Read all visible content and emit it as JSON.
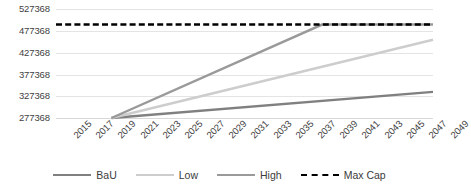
{
  "chart_data": {
    "type": "line",
    "title": "",
    "xlabel": "",
    "ylabel": "",
    "x": [
      2015,
      2017,
      2019,
      2021,
      2023,
      2025,
      2027,
      2029,
      2031,
      2033,
      2035,
      2037,
      2039,
      2041,
      2043,
      2045,
      2047,
      2049
    ],
    "xtick_labels": [
      "2015",
      "2017",
      "2019",
      "2021",
      "2023",
      "2025",
      "2027",
      "2029",
      "2031",
      "2033",
      "2035",
      "2037",
      "2039",
      "2041",
      "2043",
      "2045",
      "2047",
      "2049"
    ],
    "ytick_labels": [
      "527368",
      "477368",
      "427368",
      "377368",
      "327368",
      "277368"
    ],
    "ytick_values": [
      527368,
      477368,
      427368,
      377368,
      327368,
      277368
    ],
    "ylim": [
      277368,
      537368
    ],
    "xlim": [
      2015,
      2049
    ],
    "grid": true,
    "legend_position": "bottom",
    "series": [
      {
        "name": "BaU",
        "color": "#808080",
        "style": "solid",
        "points": [
          {
            "x": 2020,
            "y": 277368
          },
          {
            "x": 2049,
            "y": 337368
          }
        ]
      },
      {
        "name": "Low",
        "color": "#cdcdcd",
        "style": "solid",
        "points": [
          {
            "x": 2020,
            "y": 277368
          },
          {
            "x": 2049,
            "y": 457368
          }
        ]
      },
      {
        "name": "High",
        "color": "#9a9a9a",
        "style": "solid",
        "points": [
          {
            "x": 2020,
            "y": 277368
          },
          {
            "x": 2039,
            "y": 492368
          },
          {
            "x": 2049,
            "y": 492368
          }
        ]
      },
      {
        "name": "Max Cap",
        "color": "#000000",
        "style": "dashed",
        "points": [
          {
            "x": 2015,
            "y": 492368
          },
          {
            "x": 2049,
            "y": 492368
          }
        ]
      }
    ]
  },
  "legend": {
    "items": [
      {
        "label": "BaU",
        "color": "#808080",
        "style": "solid"
      },
      {
        "label": "Low",
        "color": "#cdcdcd",
        "style": "solid"
      },
      {
        "label": "High",
        "color": "#9a9a9a",
        "style": "solid"
      },
      {
        "label": "Max Cap",
        "color": "#000000",
        "style": "dashed"
      }
    ]
  }
}
